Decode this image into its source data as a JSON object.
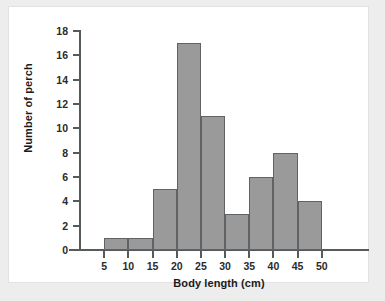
{
  "chart_data": {
    "type": "bar",
    "title": "",
    "subtitle": "",
    "xlabel": "Body length (cm)",
    "ylabel": "Number of perch",
    "categories": [
      "5-10",
      "10-15",
      "15-20",
      "20-25",
      "25-30",
      "30-35",
      "35-40",
      "40-45",
      "45-50"
    ],
    "bin_edges": [
      5,
      10,
      15,
      20,
      25,
      30,
      35,
      40,
      45,
      50
    ],
    "bin_width": 5,
    "values": [
      1,
      1,
      5,
      17,
      11,
      3,
      6,
      8,
      4
    ],
    "x": [
      7.5,
      12.5,
      17.5,
      22.5,
      27.5,
      32.5,
      37.5,
      42.5,
      47.5
    ],
    "xlim": [
      0,
      55
    ],
    "ylim": [
      0,
      18
    ],
    "x_ticks": [
      5,
      10,
      15,
      20,
      25,
      30,
      35,
      40,
      45,
      50
    ],
    "x_tick_labels": [
      "5",
      "10",
      "15",
      "20",
      "25",
      "30",
      "35",
      "40",
      "45",
      "50"
    ],
    "y_ticks": [
      0,
      2,
      4,
      6,
      8,
      10,
      12,
      14,
      16,
      18
    ],
    "y_tick_labels": [
      "0",
      "2",
      "4",
      "6",
      "8",
      "10",
      "12",
      "14",
      "16",
      "18"
    ],
    "grid": false,
    "legend": null,
    "colors": {
      "bar_fill": "#9a9a9a",
      "bar_stroke": "#5f6365",
      "axis": "#555a5c",
      "text": "#1b1b1b",
      "panel_background": "#ffffff",
      "figure_background": "#ededed"
    }
  }
}
